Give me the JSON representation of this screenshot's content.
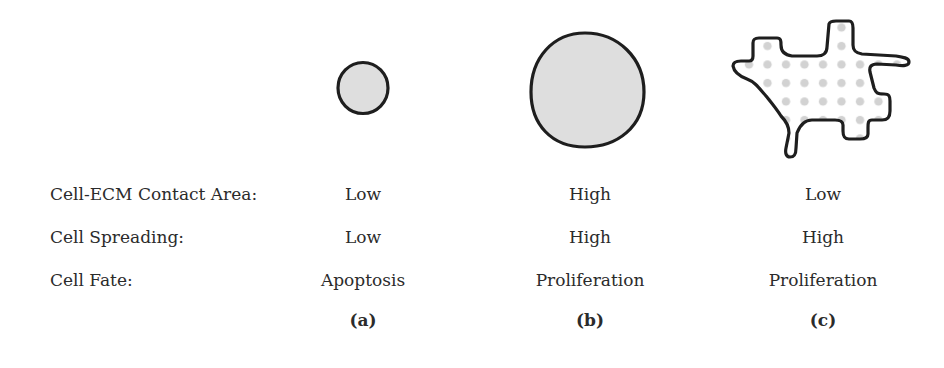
{
  "figure": {
    "row_labels": [
      "Cell-ECM Contact Area:",
      "Cell Spreading:",
      "Cell Fate:"
    ],
    "panels": [
      {
        "id": "a",
        "label": "(a)",
        "shape": "small-round-cell",
        "contact_area": "Low",
        "spreading": "Low",
        "fate": "Apoptosis"
      },
      {
        "id": "b",
        "label": "(b)",
        "shape": "large-round-cell",
        "contact_area": "High",
        "spreading": "High",
        "fate": "Proliferation"
      },
      {
        "id": "c",
        "label": "(c)",
        "shape": "spread-cell-on-dotted-ecm",
        "contact_area": "Low",
        "spreading": "High",
        "fate": "Proliferation"
      }
    ],
    "colors": {
      "cell_fill": "#dcdcdc",
      "outline": "#1e1e1e",
      "ecm_dot": "#cfcfcf",
      "text": "#2b2b2b"
    }
  }
}
